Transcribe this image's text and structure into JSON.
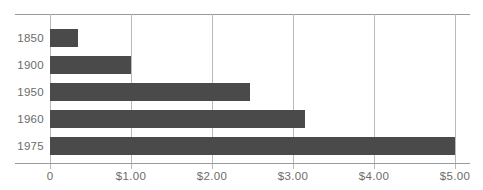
{
  "chart_data": {
    "type": "bar",
    "orientation": "horizontal",
    "title": "",
    "subtitle": "",
    "xlabel": "",
    "ylabel": "",
    "categories": [
      "1850",
      "1900",
      "1950",
      "1960",
      "1975"
    ],
    "values": [
      0.35,
      1.0,
      2.47,
      3.15,
      5.0
    ],
    "series": [
      {
        "name": "",
        "values": [
          0.35,
          1.0,
          2.47,
          3.15,
          5.0
        ]
      }
    ],
    "xlim": [
      0,
      5
    ],
    "ylim": null,
    "x_tick_values": [
      0,
      1,
      2,
      3,
      4,
      5
    ],
    "x_tick_labels": [
      "0",
      "$1.00",
      "$2.00",
      "$3.00",
      "$4.00",
      "$5.00"
    ],
    "y_tick_labels": [
      "1850",
      "1900",
      "1950",
      "1960",
      "1975"
    ],
    "grid": "vertical",
    "legend": null,
    "legend_position": "none",
    "annotations": [],
    "colors": {
      "bar": "#4a4a4a",
      "gridline": "#b9b9b9",
      "axis_rule": "#9a9a9a",
      "tick_label": "#6b6b6b",
      "background": "#ffffff"
    }
  }
}
